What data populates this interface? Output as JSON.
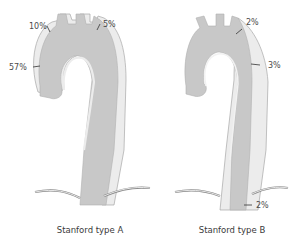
{
  "figure": {
    "colors": {
      "lumen": "#c8c8c8",
      "false_lumen": "#ececec",
      "outline": "#a0a0a0",
      "diaphragm": "#888888",
      "text": "#4a4a4a"
    },
    "panels": [
      {
        "caption": "Stanford type A",
        "labels": [
          {
            "text": "10%",
            "site": "proximal-arch-left"
          },
          {
            "text": "5%",
            "site": "distal-arch-right"
          },
          {
            "text": "57%",
            "site": "ascending-aorta"
          }
        ]
      },
      {
        "caption": "Stanford type B",
        "labels": [
          {
            "text": "2%",
            "site": "distal-arch"
          },
          {
            "text": "3%",
            "site": "descending-thoracic"
          },
          {
            "text": "2%",
            "site": "abdominal"
          }
        ]
      }
    ]
  }
}
